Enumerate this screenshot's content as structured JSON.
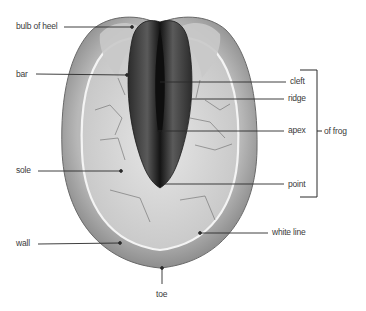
{
  "diagram": {
    "colors": {
      "background": "#ffffff",
      "wall": "#a9a9a9",
      "wall_dark": "#6e6e6e",
      "sole": "#d2d2d2",
      "sole_light": "#e4e4e4",
      "frog": "#3a3a3a",
      "frog_dark": "#151515",
      "leader_line": "#2a2a2a",
      "label_text": "#3a3a3a"
    },
    "labels": {
      "bulb_of_heel": "bulb of heel",
      "bar": "bar",
      "sole": "sole",
      "wall": "wall",
      "toe": "toe",
      "cleft": "cleft",
      "ridge": "ridge",
      "apex": "apex",
      "point": "point",
      "white_line": "white line",
      "of_frog": "of frog"
    },
    "bracket": {
      "groups": [
        "cleft",
        "ridge",
        "apex",
        "point"
      ],
      "label": "of frog"
    }
  }
}
